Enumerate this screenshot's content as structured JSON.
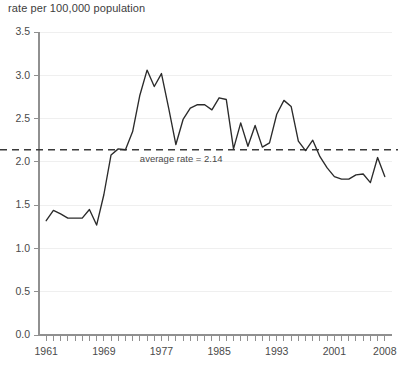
{
  "chart_data": {
    "type": "line",
    "title": "rate per 100,000 population",
    "xlabel": "",
    "ylabel": "rate per 100,000 population",
    "xlim": [
      1960,
      2009
    ],
    "ylim": [
      0.0,
      3.5
    ],
    "grid": true,
    "legend": "none",
    "ytick_labels": [
      "0.0",
      "0.5",
      "1.0",
      "1.5",
      "2.0",
      "2.5",
      "3.0",
      "3.5"
    ],
    "ytick_values": [
      0.0,
      0.5,
      1.0,
      1.5,
      2.0,
      2.5,
      3.0,
      3.5
    ],
    "xtick_labels": [
      "1961",
      "1969",
      "1977",
      "1985",
      "1993",
      "2001",
      "2008"
    ],
    "xtick_values": [
      1961,
      1969,
      1977,
      1985,
      1993,
      2001,
      2008
    ],
    "minor_tick_start": 1961,
    "minor_tick_end": 2008,
    "minor_tick_step": 1,
    "annotations": [
      {
        "name": "average-rate-line",
        "label": "average rate = 2.14",
        "value": 2.14,
        "style": "dashed-horizontal",
        "label_x": 1974,
        "color": "#3a3a3a"
      }
    ],
    "series": [
      {
        "name": "rate",
        "color": "#2b2b2b",
        "x": [
          1961,
          1962,
          1963,
          1964,
          1965,
          1966,
          1967,
          1968,
          1969,
          1970,
          1971,
          1972,
          1973,
          1974,
          1975,
          1976,
          1977,
          1978,
          1979,
          1980,
          1981,
          1982,
          1983,
          1984,
          1985,
          1986,
          1987,
          1988,
          1989,
          1990,
          1991,
          1992,
          1993,
          1994,
          1995,
          1996,
          1997,
          1998,
          1999,
          2000,
          2001,
          2002,
          2003,
          2004,
          2005,
          2006,
          2007,
          2008
        ],
        "values": [
          1.32,
          1.44,
          1.4,
          1.35,
          1.35,
          1.35,
          1.45,
          1.27,
          1.62,
          2.08,
          2.15,
          2.14,
          2.35,
          2.77,
          3.06,
          2.87,
          3.02,
          2.62,
          2.2,
          2.49,
          2.62,
          2.66,
          2.66,
          2.6,
          2.74,
          2.72,
          2.15,
          2.45,
          2.18,
          2.42,
          2.17,
          2.22,
          2.55,
          2.71,
          2.64,
          2.24,
          2.13,
          2.25,
          2.06,
          1.93,
          1.83,
          1.8,
          1.8,
          1.85,
          1.86,
          1.76,
          2.05,
          1.83
        ]
      }
    ]
  }
}
